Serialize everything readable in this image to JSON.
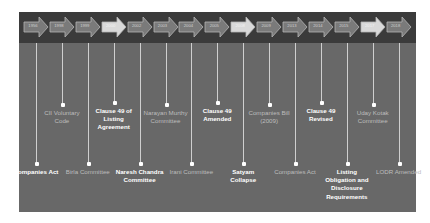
{
  "colors": {
    "band": "#3b3b3b",
    "panel": "#686868",
    "arrow": "#7a7a7a",
    "arrow_highlight": "#d9d9d9",
    "line": "#cfcfcf",
    "text_bright": "#ffffff",
    "text_dim": "#bdbdbd"
  },
  "timeline": {
    "years": [
      {
        "label": "1956",
        "highlight": false
      },
      {
        "label": "1998",
        "highlight": false
      },
      {
        "label": "1999",
        "highlight": false
      },
      {
        "label": "2000",
        "highlight": true
      },
      {
        "label": "2002",
        "highlight": false
      },
      {
        "label": "2003",
        "highlight": false
      },
      {
        "label": "2004",
        "highlight": false
      },
      {
        "label": "2005",
        "highlight": false
      },
      {
        "label": "2008",
        "highlight": true
      },
      {
        "label": "2009",
        "highlight": false
      },
      {
        "label": "2013",
        "highlight": false
      },
      {
        "label": "2014",
        "highlight": false
      },
      {
        "label": "2015",
        "highlight": false
      },
      {
        "label": "2017",
        "highlight": true
      },
      {
        "label": "2018",
        "highlight": false
      }
    ],
    "events": [
      {
        "year": "1956",
        "text": "Companies Act",
        "position": "bottom",
        "emphasis": "bright"
      },
      {
        "year": "1998",
        "text": "CII Voluntary Code",
        "position": "top",
        "emphasis": "dim"
      },
      {
        "year": "1999",
        "text": "Birla Committee",
        "position": "bottom",
        "emphasis": "dim"
      },
      {
        "year": "2000",
        "text": "Clause 49 of Listing Agreement",
        "position": "top",
        "emphasis": "bright"
      },
      {
        "year": "2002",
        "text": "Naresh Chandra Committee",
        "position": "bottom",
        "emphasis": "bright"
      },
      {
        "year": "2003",
        "text": "Narayan Murthy Committee",
        "position": "top",
        "emphasis": "dim"
      },
      {
        "year": "2004",
        "text": "Irani Committee",
        "position": "bottom",
        "emphasis": "dim"
      },
      {
        "year": "2005",
        "text": "Clause 49 Amended",
        "position": "top",
        "emphasis": "bright"
      },
      {
        "year": "2008",
        "text": "Satyam Collapse",
        "position": "bottom",
        "emphasis": "bright"
      },
      {
        "year": "2009",
        "text": "Companies Bill (2009)",
        "position": "top",
        "emphasis": "dim"
      },
      {
        "year": "2013",
        "text": "Companies Act",
        "position": "bottom",
        "emphasis": "dim"
      },
      {
        "year": "2014",
        "text": "Clause 49 Revised",
        "position": "top",
        "emphasis": "bright"
      },
      {
        "year": "2015",
        "text": "Listing Obligation and Disclosure Requirements",
        "position": "bottom",
        "emphasis": "bright"
      },
      {
        "year": "2017",
        "text": "Uday Kotak Committee",
        "position": "top",
        "emphasis": "dim"
      },
      {
        "year": "2018",
        "text": "LODR Amended",
        "position": "bottom",
        "emphasis": "dim"
      }
    ]
  }
}
